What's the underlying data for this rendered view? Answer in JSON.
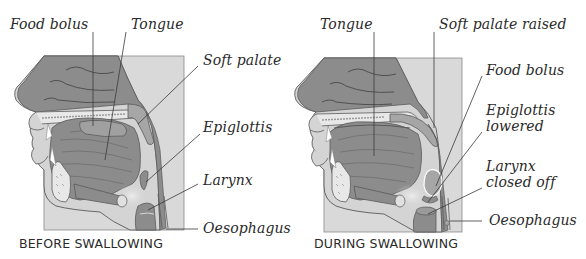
{
  "colors": {
    "tissue_dark": "#8c8c8c",
    "tissue_mid": "#a6a6a6",
    "tissue_light": "#d4d4d4",
    "background_box": "#d9d9d9",
    "bone_fill": "#e8e8e8",
    "outline": "#5a5a5a",
    "leader_line": "#3a3a3a",
    "text": "#2a2a2a"
  },
  "panels": {
    "before": {
      "caption": "BEFORE SWALLOWING",
      "labels": {
        "food_bolus": "Food bolus",
        "tongue": "Tongue",
        "soft_palate": "Soft palate",
        "epiglottis": "Epiglottis",
        "larynx": "Larynx",
        "oesophagus": "Oesophagus"
      }
    },
    "during": {
      "caption": "DURING SWALLOWING",
      "labels": {
        "tongue": "Tongue",
        "soft_palate_raised": "Soft palate raised",
        "food_bolus": "Food bolus",
        "epiglottis_line1": "Epiglottis",
        "epiglottis_line2": "lowered",
        "larynx_line1": "Larynx",
        "larynx_line2": "closed off",
        "oesophagus": "Oesophagus"
      }
    }
  }
}
